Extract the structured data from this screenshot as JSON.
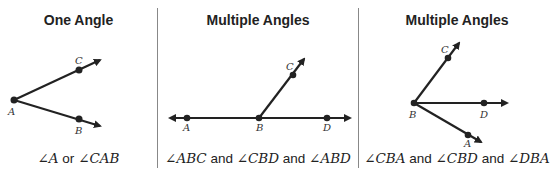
{
  "panels": [
    {
      "title": "One Angle",
      "caption": [
        "∠A",
        " or ",
        "∠CAB"
      ],
      "points": {
        "A": "A",
        "B": "B",
        "C": "C"
      }
    },
    {
      "title": "Multiple Angles",
      "caption": [
        "∠ABC",
        " and ",
        "∠CBD",
        " and ",
        "∠ABD"
      ],
      "points": {
        "A": "A",
        "B": "B",
        "C": "C",
        "D": "D"
      }
    },
    {
      "title": "Multiple Angles",
      "caption": [
        "∠CBA",
        " and ",
        "∠CBD",
        " and ",
        "∠DBA"
      ],
      "points": {
        "A": "A",
        "B": "B",
        "C": "C",
        "D": "D"
      }
    }
  ]
}
